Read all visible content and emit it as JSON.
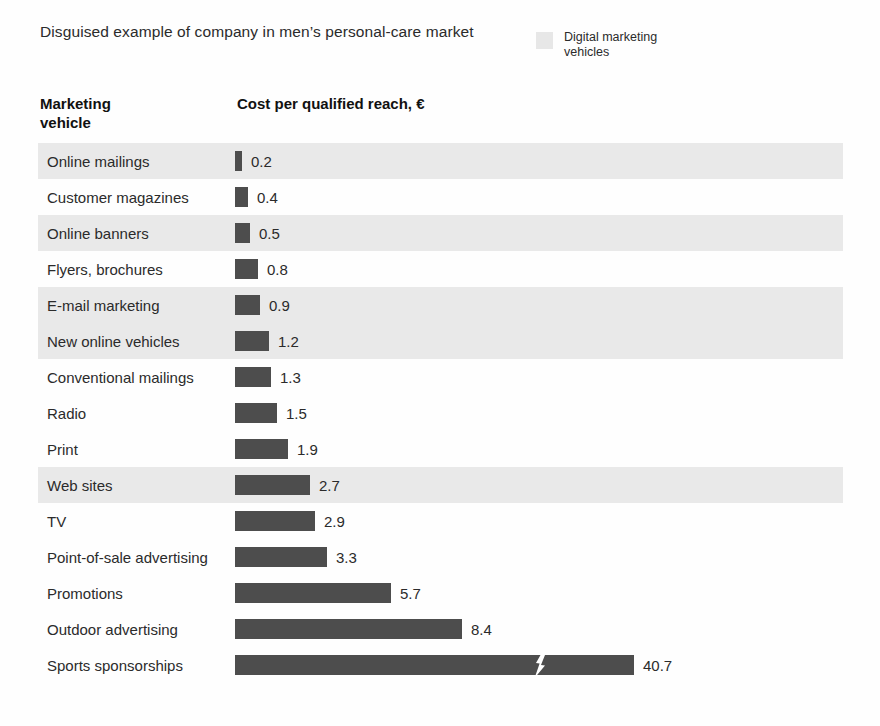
{
  "header": {
    "subtitle": "Disguised example of company in men’s personal-care market",
    "legend": {
      "swatch_name": "legend-swatch-digital",
      "label": "Digital marketing vehicles",
      "color": "#e7e7e7"
    }
  },
  "columns": {
    "vehicle": "Marketing vehicle",
    "vehicle_line1": "Marketing",
    "vehicle_line2": "vehicle",
    "cost": "Cost per qualified reach, €"
  },
  "chart_data": {
    "type": "bar",
    "orientation": "horizontal",
    "title": "Cost per qualified reach, €",
    "subtitle": "Disguised example of company in men’s personal-care market",
    "xlabel": "Cost per qualified reach, €",
    "ylabel": "Marketing vehicle",
    "grid": false,
    "legend_position": "top-right",
    "legend_entries": [
      "Digital marketing vehicles"
    ],
    "bar_color": "#4d4d4d",
    "highlight_color": "#e9e9e9",
    "axis_break": {
      "present": true,
      "applies_to": "Sports sponsorships",
      "note": "Bar is truncated with a zigzag break; value 40.7 is off-scale."
    },
    "pixels_per_unit": 27,
    "categories": [
      "Online mailings",
      "Customer magazines",
      "Online banners",
      "Flyers, brochures",
      "E-mail marketing",
      "New online vehicles",
      "Conventional mailings",
      "Radio",
      "Print",
      "Web sites",
      "TV",
      "Point-of-sale advertising",
      "Promotions",
      "Outdoor advertising",
      "Sports sponsorships"
    ],
    "values": [
      0.2,
      0.4,
      0.5,
      0.8,
      0.9,
      1.2,
      1.3,
      1.5,
      1.9,
      2.7,
      2.9,
      3.3,
      5.7,
      8.4,
      40.7
    ],
    "digital": [
      true,
      false,
      true,
      false,
      true,
      true,
      false,
      false,
      false,
      true,
      false,
      false,
      false,
      false,
      false
    ]
  },
  "rows": [
    {
      "label": "Online mailings",
      "value": "0.2",
      "bar_px": 7,
      "digital": true,
      "break": false
    },
    {
      "label": "Customer magazines",
      "value": "0.4",
      "bar_px": 13,
      "digital": false,
      "break": false
    },
    {
      "label": "Online banners",
      "value": "0.5",
      "bar_px": 15,
      "digital": true,
      "break": false
    },
    {
      "label": "Flyers, brochures",
      "value": "0.8",
      "bar_px": 23,
      "digital": false,
      "break": false
    },
    {
      "label": "E-mail marketing",
      "value": "0.9",
      "bar_px": 25,
      "digital": true,
      "break": false
    },
    {
      "label": "New online vehicles",
      "value": "1.2",
      "bar_px": 34,
      "digital": true,
      "break": false
    },
    {
      "label": "Conventional mailings",
      "value": "1.3",
      "bar_px": 36,
      "digital": false,
      "break": false
    },
    {
      "label": "Radio",
      "value": "1.5",
      "bar_px": 42,
      "digital": false,
      "break": false
    },
    {
      "label": "Print",
      "value": "1.9",
      "bar_px": 53,
      "digital": false,
      "break": false
    },
    {
      "label": "Web sites",
      "value": "2.7",
      "bar_px": 75,
      "digital": true,
      "break": false
    },
    {
      "label": "TV",
      "value": "2.9",
      "bar_px": 80,
      "digital": false,
      "break": false
    },
    {
      "label": "Point-of-sale advertising",
      "value": "3.3",
      "bar_px": 92,
      "digital": false,
      "break": false
    },
    {
      "label": "Promotions",
      "value": "5.7",
      "bar_px": 156,
      "digital": false,
      "break": false
    },
    {
      "label": "Outdoor advertising",
      "value": "8.4",
      "bar_px": 227,
      "digital": false,
      "break": false
    },
    {
      "label": "Sports sponsorships",
      "value": "40.7",
      "bar_px": 399,
      "digital": false,
      "break": true,
      "break_px": 305
    }
  ]
}
